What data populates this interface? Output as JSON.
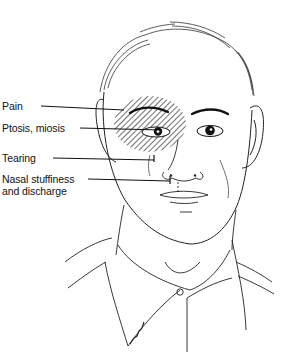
{
  "figure": {
    "labels": [
      {
        "id": "pain",
        "text": "Pain"
      },
      {
        "id": "ptosis",
        "text": "Ptosis, miosis"
      },
      {
        "id": "tearing",
        "text": "Tearing"
      },
      {
        "id": "nasal",
        "line1": "Nasal stuffiness",
        "line2": "and discharge"
      }
    ],
    "colors": {
      "ink": "#111111",
      "background": "#ffffff"
    }
  }
}
